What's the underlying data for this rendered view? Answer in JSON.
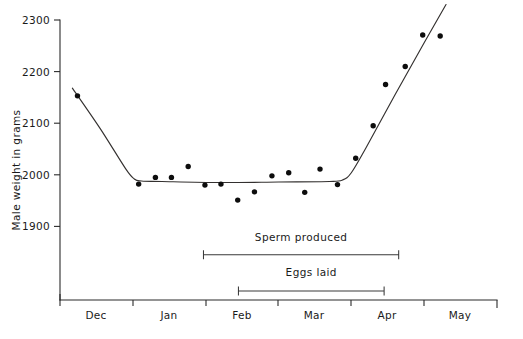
{
  "chart_data": {
    "type": "scatter",
    "title": "",
    "xlabel": "",
    "ylabel": "Male weight in grams",
    "ylim": [
      1750,
      2320
    ],
    "xlim": [
      0,
      6.0
    ],
    "grid": false,
    "legend": null,
    "y_ticks": [
      1900,
      2000,
      2100,
      2200,
      2300
    ],
    "y_tick_labels": [
      "1900",
      "2000",
      "2100",
      "2200",
      "2300"
    ],
    "x_tick_labels": [
      "Dec",
      "Jan",
      "Feb",
      "Mar",
      "Apr",
      "May"
    ],
    "x_tick_boundaries": [
      0,
      1,
      2,
      3,
      4,
      5,
      6
    ],
    "series": [
      {
        "name": "Male weight observations",
        "marker": "filled-circle",
        "color": "#0d0d0d",
        "points": [
          {
            "month": "Dec",
            "x": 0.24,
            "y": 2153
          },
          {
            "month": "Dec",
            "x": 1.08,
            "y": 1982
          },
          {
            "month": "Jan",
            "x": 1.31,
            "y": 1995
          },
          {
            "month": "Jan",
            "x": 1.53,
            "y": 1995
          },
          {
            "month": "Jan",
            "x": 1.76,
            "y": 2016
          },
          {
            "month": "Jan",
            "x": 1.99,
            "y": 1980
          },
          {
            "month": "Feb",
            "x": 2.21,
            "y": 1982
          },
          {
            "month": "Feb",
            "x": 2.44,
            "y": 1951
          },
          {
            "month": "Feb",
            "x": 2.67,
            "y": 1967
          },
          {
            "month": "Feb",
            "x": 2.91,
            "y": 1998
          },
          {
            "month": "Mar",
            "x": 3.14,
            "y": 2004
          },
          {
            "month": "Mar",
            "x": 3.36,
            "y": 1966
          },
          {
            "month": "Mar",
            "x": 3.57,
            "y": 2011
          },
          {
            "month": "Mar",
            "x": 3.81,
            "y": 1981
          },
          {
            "month": "Apr",
            "x": 4.06,
            "y": 2032
          },
          {
            "month": "Apr",
            "x": 4.3,
            "y": 2095
          },
          {
            "month": "Apr",
            "x": 4.47,
            "y": 2175
          },
          {
            "month": "Apr",
            "x": 4.74,
            "y": 2210
          },
          {
            "month": "May",
            "x": 4.98,
            "y": 2271
          },
          {
            "month": "May",
            "x": 5.22,
            "y": 2269
          }
        ]
      }
    ],
    "fitted_curve": {
      "name": "fitted trend",
      "color": "#33302f",
      "points": [
        {
          "x": 0.17,
          "y": 2168
        },
        {
          "x": 0.55,
          "y": 2090
        },
        {
          "x": 0.9,
          "y": 2012
        },
        {
          "x": 1.02,
          "y": 1992
        },
        {
          "x": 1.12,
          "y": 1988
        },
        {
          "x": 1.4,
          "y": 1987
        },
        {
          "x": 2.2,
          "y": 1985
        },
        {
          "x": 3.0,
          "y": 1986
        },
        {
          "x": 3.7,
          "y": 1987
        },
        {
          "x": 3.88,
          "y": 1990
        },
        {
          "x": 4.0,
          "y": 2004
        },
        {
          "x": 4.2,
          "y": 2052
        },
        {
          "x": 4.6,
          "y": 2155
        },
        {
          "x": 5.0,
          "y": 2256
        },
        {
          "x": 5.3,
          "y": 2330
        }
      ]
    },
    "annotations": [
      {
        "id": "sperm-produced",
        "label": "Sperm  produced",
        "type": "range-bar",
        "x_start": 1.97,
        "x_end": 4.65,
        "y_level": 1845,
        "label_y": 1872
      },
      {
        "id": "eggs-laid",
        "label": "Eggs  laid",
        "type": "range-bar",
        "x_start": 2.45,
        "x_end": 4.45,
        "y_level": 1775,
        "label_y": 1803
      }
    ]
  }
}
